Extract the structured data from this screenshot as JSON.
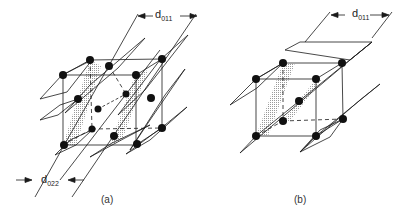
{
  "figure": {
    "panel_a": {
      "caption": "(a)",
      "top_spacing_label": "d",
      "top_spacing_sub": "011",
      "bottom_spacing_label": "d",
      "bottom_spacing_sub": "022",
      "lattice": "face-centered cubic",
      "atom_count": 14
    },
    "panel_b": {
      "caption": "(b)",
      "top_spacing_label": "d",
      "top_spacing_sub": "011",
      "lattice": "body-centered cubic",
      "atom_count": 9
    }
  },
  "colors": {
    "line": "#1a1a1a",
    "atom": "#111111",
    "shading": "#c8c8c8"
  }
}
